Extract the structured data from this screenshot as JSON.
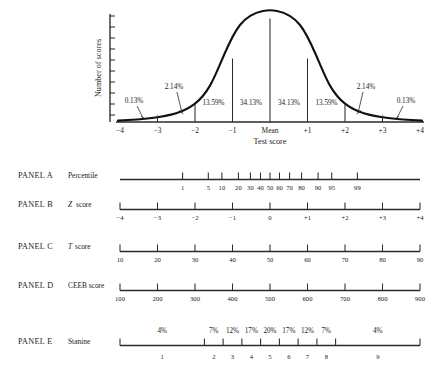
{
  "figure": {
    "curve": {
      "y_axis_label": "Number of scores",
      "x_axis_label": "Test score",
      "x_ticks": [
        "−4",
        "−3",
        "−2",
        "−1",
        "Mean",
        "+1",
        "+2",
        "+3",
        "+4"
      ],
      "region_labels": [
        {
          "text": "0.13%",
          "side": "left"
        },
        {
          "text": "2.14%",
          "side": "left"
        },
        {
          "text": "13.59%",
          "side": "left"
        },
        {
          "text": "34.13%",
          "side": "left"
        },
        {
          "text": "34.13%",
          "side": "right"
        },
        {
          "text": "13.59%",
          "side": "right"
        },
        {
          "text": "2.14%",
          "side": "right"
        },
        {
          "text": "0.13%",
          "side": "right"
        }
      ]
    },
    "panels": [
      {
        "id": "A",
        "panel_label": "PANEL A",
        "scale_label": "Percentile",
        "scale_label_italic_prefix": "",
        "ticks": [
          {
            "label": "1",
            "z": -2.33
          },
          {
            "label": "5",
            "z": -1.645
          },
          {
            "label": "10",
            "z": -1.282
          },
          {
            "label": "20",
            "z": -0.842
          },
          {
            "label": "30",
            "z": -0.524
          },
          {
            "label": "40",
            "z": -0.253
          },
          {
            "label": "50",
            "z": 0.0
          },
          {
            "label": "60",
            "z": 0.253
          },
          {
            "label": "70",
            "z": 0.524
          },
          {
            "label": "80",
            "z": 0.842
          },
          {
            "label": "90",
            "z": 1.282
          },
          {
            "label": "95",
            "z": 1.645
          },
          {
            "label": "99",
            "z": 2.33
          }
        ]
      },
      {
        "id": "B",
        "panel_label": "PANEL B",
        "scale_label": "score",
        "scale_label_italic_prefix": "Z",
        "ticks": [
          {
            "label": "−4",
            "z": -4
          },
          {
            "label": "−3",
            "z": -3
          },
          {
            "label": "−2",
            "z": -2
          },
          {
            "label": "−1",
            "z": -1
          },
          {
            "label": "0",
            "z": 0
          },
          {
            "label": "+1",
            "z": 1
          },
          {
            "label": "+2",
            "z": 2
          },
          {
            "label": "+3",
            "z": 3
          },
          {
            "label": "+4",
            "z": 4
          }
        ]
      },
      {
        "id": "C",
        "panel_label": "PANEL C",
        "scale_label": "score",
        "scale_label_italic_prefix": "T",
        "ticks": [
          {
            "label": "10",
            "z": -4
          },
          {
            "label": "20",
            "z": -3
          },
          {
            "label": "30",
            "z": -2
          },
          {
            "label": "40",
            "z": -1
          },
          {
            "label": "50",
            "z": 0
          },
          {
            "label": "60",
            "z": 1
          },
          {
            "label": "70",
            "z": 2
          },
          {
            "label": "80",
            "z": 3
          },
          {
            "label": "90",
            "z": 4
          }
        ]
      },
      {
        "id": "D",
        "panel_label": "PANEL D",
        "scale_label": "CEEB score",
        "scale_label_italic_prefix": "",
        "ticks": [
          {
            "label": "100",
            "z": -4
          },
          {
            "label": "200",
            "z": -3
          },
          {
            "label": "300",
            "z": -2
          },
          {
            "label": "400",
            "z": -1
          },
          {
            "label": "500",
            "z": 0
          },
          {
            "label": "600",
            "z": 1
          },
          {
            "label": "700",
            "z": 2
          },
          {
            "label": "800",
            "z": 3
          },
          {
            "label": "900",
            "z": 4
          }
        ]
      },
      {
        "id": "E",
        "panel_label": "PANEL E",
        "scale_label": "Stanine",
        "scale_label_italic_prefix": "",
        "boundaries_z": [
          -4,
          -1.75,
          -1.25,
          -0.75,
          -0.25,
          0.25,
          0.75,
          1.25,
          1.75,
          4
        ],
        "bands": [
          {
            "stanine": "1",
            "percent": "4%"
          },
          {
            "stanine": "2",
            "percent": "7%"
          },
          {
            "stanine": "3",
            "percent": "12%"
          },
          {
            "stanine": "4",
            "percent": "17%"
          },
          {
            "stanine": "5",
            "percent": "20%"
          },
          {
            "stanine": "6",
            "percent": "17%"
          },
          {
            "stanine": "7",
            "percent": "12%"
          },
          {
            "stanine": "8",
            "percent": "7%"
          },
          {
            "stanine": "9",
            "percent": "4%"
          }
        ]
      }
    ]
  },
  "colors": {
    "ink": "#1b1b1b",
    "line": "#2a2a2a",
    "background": "#ffffff"
  }
}
